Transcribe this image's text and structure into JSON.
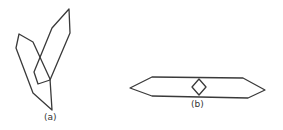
{
  "figure": {
    "panels": [
      {
        "id": "a",
        "label": "(a)",
        "description": "two overlapping elongated hexagonal crystal outlines"
      },
      {
        "id": "b",
        "label": "(b)",
        "description": "elongated horizontal hexagon with small diamond at center"
      }
    ],
    "stroke_color": "#3a3a3a",
    "background": "#ffffff"
  }
}
